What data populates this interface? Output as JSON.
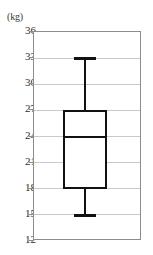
{
  "axis": {
    "unit_label": "(kg)",
    "tick_labels": [
      "36",
      "33",
      "30",
      "27",
      "24",
      "21",
      "18",
      "15",
      "12"
    ]
  },
  "chart_data": {
    "type": "box",
    "title": "",
    "subtitle": "",
    "xlabel": "",
    "ylabel": "(kg)",
    "ylim": [
      12,
      36
    ],
    "ytick_step": 3,
    "yticks": [
      12,
      15,
      18,
      21,
      24,
      27,
      30,
      33,
      36
    ],
    "grid": true,
    "legend": false,
    "categories": [
      ""
    ],
    "series": [
      {
        "name": "",
        "min": 15,
        "q1": 18,
        "median": 24,
        "q3": 27,
        "max": 33,
        "outliers": []
      }
    ],
    "colors": {
      "line": "#111111",
      "box_fill": "#ffffff",
      "grid": "#c9c9c9",
      "frame": "#8c8c8c",
      "text": "#2e2e2e"
    }
  }
}
